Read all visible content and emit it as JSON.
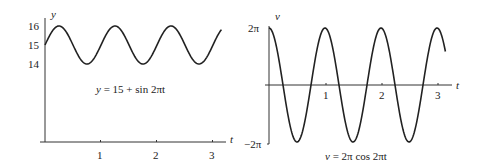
{
  "chart_data": [
    {
      "type": "line",
      "title": "",
      "annotation": "y = 15 + sin 2πt",
      "function": "15 + sin(2*pi*t)",
      "xlabel": "t",
      "ylabel": "y",
      "x_ticks": [
        "1",
        "2",
        "3"
      ],
      "y_ticks": [
        "14",
        "15",
        "16"
      ],
      "xlim": [
        0,
        3.15
      ],
      "ylim": [
        10,
        16
      ],
      "grid": false,
      "x": [
        0,
        0.25,
        0.5,
        0.75,
        1,
        1.25,
        1.5,
        1.75,
        2,
        2.25,
        2.5,
        2.75,
        3,
        3.15
      ],
      "values": [
        15,
        16,
        15,
        14,
        15,
        16,
        15,
        14,
        15,
        16,
        15,
        14,
        15,
        15.81
      ]
    },
    {
      "type": "line",
      "title": "",
      "annotation": "v = 2π cos 2πt",
      "function": "2*pi*cos(2*pi*t)",
      "xlabel": "t",
      "ylabel": "v",
      "x_ticks": [
        "1",
        "2",
        "3"
      ],
      "y_ticks": [
        "−2π",
        "2π"
      ],
      "xlim": [
        0,
        3.15
      ],
      "ylim": [
        -6.283,
        6.283
      ],
      "grid": false,
      "x": [
        0,
        0.25,
        0.5,
        0.75,
        1,
        1.25,
        1.5,
        1.75,
        2,
        2.25,
        2.5,
        2.75,
        3,
        3.15
      ],
      "values": [
        6.283,
        0,
        -6.283,
        0,
        6.283,
        0,
        -6.283,
        0,
        6.283,
        0,
        -6.283,
        0,
        6.283,
        3.693
      ]
    }
  ],
  "left": {
    "ylabel": "y",
    "xlabel": "t",
    "yticks": [
      "16",
      "15",
      "14"
    ],
    "xticks": [
      "1",
      "2",
      "3"
    ],
    "caption_lhs": "y",
    "caption_rhs": "= 15 + sin 2πt"
  },
  "right": {
    "ylabel": "v",
    "xlabel": "t",
    "ytick_top": "2π",
    "ytick_bottom": "−2π",
    "xticks": [
      "1",
      "2",
      "3"
    ],
    "caption_lhs": "v",
    "caption_rhs": "= 2π cos 2πt"
  }
}
